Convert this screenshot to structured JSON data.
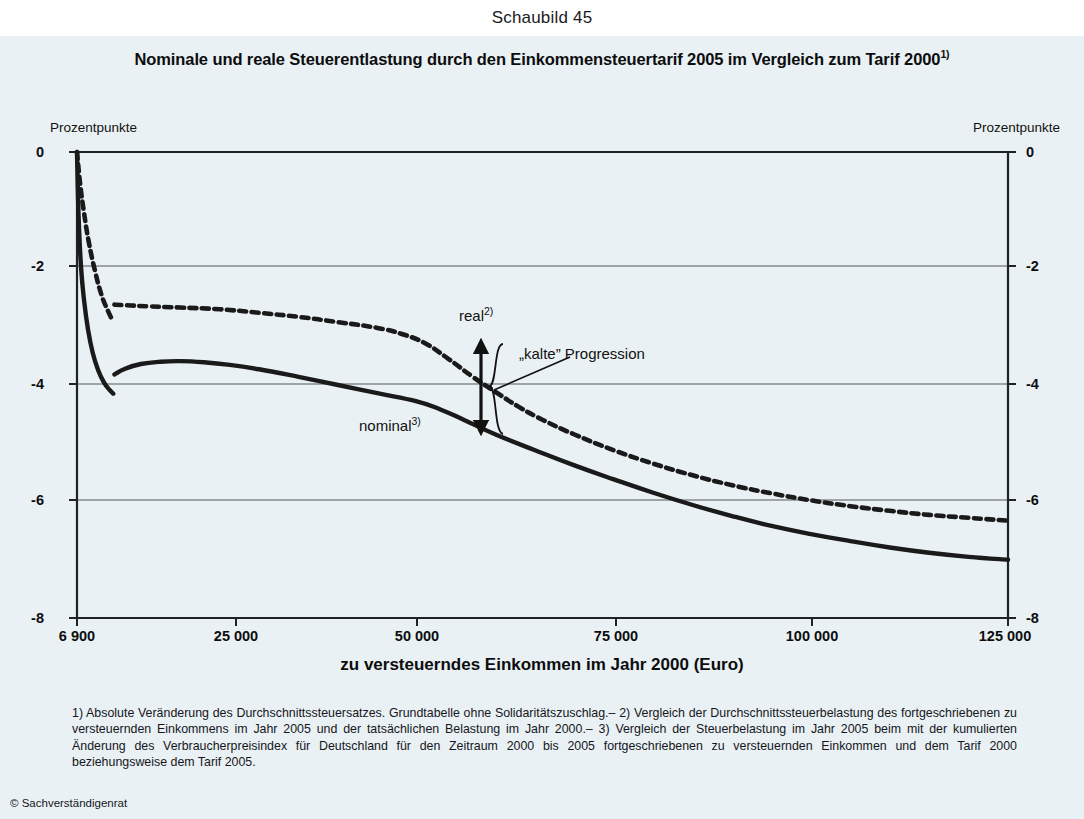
{
  "caption": "Schaubild 45",
  "title": {
    "text": "Nominale und reale Steuerentlastung durch den Einkommensteuertarif 2005 im Vergleich zum Tarif 2000",
    "sup": "1)"
  },
  "axis_unit_left": "Prozentpunkte",
  "axis_unit_right": "Prozentpunkte",
  "xaxis_title": "zu versteuerndes Einkommen im Jahr 2000 (Euro)",
  "annotations": {
    "real": "real",
    "real_sup": "2)",
    "nominal": "nominal",
    "nominal_sup": "3)",
    "kalte_progression": "„kalte” Progression"
  },
  "footnotes": "1) Absolute Veränderung des Durchschnittssteuersatzes. Grundtabelle ohne Solidaritätszuschlag.– 2) Vergleich der Durchschnittssteuerbelastung des fortgeschriebenen zu versteuernden Einkommens im Jahr 2005 und der tatsächlichen Belastung im Jahr 2000.– 3) Vergleich der Steuerbelastung im Jahr 2005 beim mit der kumulierten Änderung des Verbraucherpreisindex für Deutschland für den Zeitraum 2000 bis 2005 fortgeschriebenen zu versteuernden Einkommen und dem Tarif 2000 beziehungsweise dem Tarif 2005.",
  "copyright": "© Sachverständigenrat",
  "colors": {
    "panel": "#e9f1f5",
    "line": "#1a1a1a",
    "grid": "#55595c",
    "axis": "#1f2326"
  },
  "chart_data": {
    "type": "line",
    "title": "Nominale und reale Steuerentlastung durch den Einkommensteuertarif 2005 im Vergleich zum Tarif 2000",
    "xlabel": "zu versteuerndes Einkommen im Jahr 2000 (Euro)",
    "ylabel": "Prozentpunkte",
    "xlim": [
      6900,
      125000
    ],
    "ylim": [
      -8,
      0
    ],
    "xticks": [
      6900,
      25000,
      50000,
      75000,
      100000,
      125000
    ],
    "xtick_labels": [
      "6 900",
      "25 000",
      "50 000",
      "75 000",
      "100 000",
      "125 000"
    ],
    "yticks": [
      0,
      -2,
      -4,
      -6,
      -8
    ],
    "ytick_labels": [
      "0",
      "-2",
      "-4",
      "-6",
      "-8"
    ],
    "grid": true,
    "legend": "inline-annotations",
    "series": [
      {
        "name": "real",
        "style": "dotted",
        "note": "Vergleich der Durchschnittssteuerbelastung des fortgeschriebenen zu versteuernden Einkommens im Jahr 2005 und der tatsächlichen Belastung im Jahr 2000",
        "points": [
          [
            6900,
            0.0
          ],
          [
            7300,
            -0.55
          ],
          [
            7800,
            -1.05
          ],
          [
            8400,
            -1.55
          ],
          [
            9200,
            -2.05
          ],
          [
            10000,
            -2.45
          ],
          [
            10800,
            -2.72
          ],
          [
            11500,
            -2.92
          ],
          [
            11650,
            -2.62
          ],
          [
            13000,
            -2.63
          ],
          [
            16000,
            -2.65
          ],
          [
            20000,
            -2.67
          ],
          [
            25000,
            -2.7
          ],
          [
            30000,
            -2.76
          ],
          [
            35000,
            -2.83
          ],
          [
            40000,
            -2.92
          ],
          [
            45000,
            -3.02
          ],
          [
            48000,
            -3.12
          ],
          [
            51000,
            -3.28
          ],
          [
            54000,
            -3.55
          ],
          [
            57000,
            -3.85
          ],
          [
            60000,
            -4.12
          ],
          [
            63000,
            -4.38
          ],
          [
            66000,
            -4.6
          ],
          [
            70000,
            -4.85
          ],
          [
            75000,
            -5.12
          ],
          [
            80000,
            -5.35
          ],
          [
            85000,
            -5.55
          ],
          [
            90000,
            -5.72
          ],
          [
            95000,
            -5.86
          ],
          [
            100000,
            -5.98
          ],
          [
            105000,
            -6.08
          ],
          [
            110000,
            -6.16
          ],
          [
            115000,
            -6.23
          ],
          [
            120000,
            -6.28
          ],
          [
            125000,
            -6.33
          ]
        ]
      },
      {
        "name": "nominal",
        "style": "solid",
        "note": "Vergleich der Steuerbelastung im Jahr 2005 beim fortgeschriebenen zu versteuernden Einkommen und dem Tarif 2000 beziehungsweise dem Tarif 2005",
        "points": [
          [
            6900,
            0.0
          ],
          [
            7100,
            -1.1
          ],
          [
            7400,
            -1.95
          ],
          [
            7800,
            -2.55
          ],
          [
            8300,
            -3.05
          ],
          [
            8900,
            -3.45
          ],
          [
            9600,
            -3.75
          ],
          [
            10300,
            -3.95
          ],
          [
            11000,
            -4.08
          ],
          [
            11500,
            -4.15
          ],
          [
            11650,
            -3.82
          ],
          [
            13000,
            -3.72
          ],
          [
            15000,
            -3.64
          ],
          [
            17500,
            -3.6
          ],
          [
            20000,
            -3.59
          ],
          [
            23000,
            -3.61
          ],
          [
            26000,
            -3.65
          ],
          [
            30000,
            -3.73
          ],
          [
            35000,
            -3.86
          ],
          [
            40000,
            -4.0
          ],
          [
            45000,
            -4.14
          ],
          [
            50000,
            -4.28
          ],
          [
            53000,
            -4.42
          ],
          [
            56000,
            -4.6
          ],
          [
            60000,
            -4.85
          ],
          [
            65000,
            -5.12
          ],
          [
            70000,
            -5.38
          ],
          [
            75000,
            -5.62
          ],
          [
            80000,
            -5.85
          ],
          [
            85000,
            -6.06
          ],
          [
            90000,
            -6.25
          ],
          [
            95000,
            -6.42
          ],
          [
            100000,
            -6.56
          ],
          [
            105000,
            -6.68
          ],
          [
            110000,
            -6.79
          ],
          [
            115000,
            -6.88
          ],
          [
            120000,
            -6.95
          ],
          [
            125000,
            -7.0
          ]
        ]
      }
    ],
    "annotations": [
      {
        "label": "real",
        "x": 57000,
        "y": -3.15
      },
      {
        "label": "nominal",
        "x": 44000,
        "y": -4.62
      },
      {
        "label": "„kalte” Progression",
        "x": 66000,
        "y": -3.62
      }
    ]
  }
}
